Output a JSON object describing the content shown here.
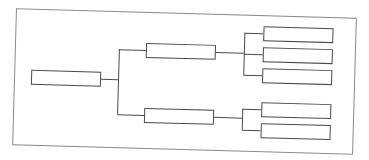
{
  "diagram": {
    "type": "tree",
    "colors": {
      "frame": "#8a8a8a",
      "stroke": "#4a4a4a",
      "background": "#ffffff"
    },
    "root": {
      "label": "",
      "children": [
        {
          "label": "",
          "children": [
            {
              "label": ""
            },
            {
              "label": ""
            },
            {
              "label": ""
            }
          ]
        },
        {
          "label": "",
          "children": [
            {
              "label": ""
            },
            {
              "label": ""
            }
          ]
        }
      ]
    }
  }
}
